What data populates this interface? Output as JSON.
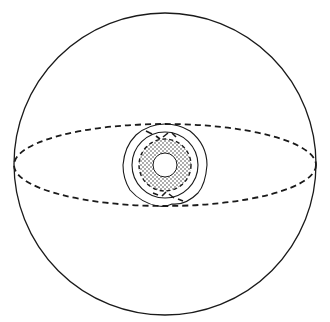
{
  "diagram": {
    "stroke_color": "#1a1a1a",
    "background": "#ffffff",
    "sphere": {
      "cx": 165,
      "cy": 164,
      "r": 151
    },
    "equator": {
      "cx": 165,
      "cy": 165,
      "rx": 151,
      "ry": 41,
      "style": "dashed"
    },
    "core": {
      "cx": 165,
      "cy": 165,
      "outer_ring_r": 41,
      "middle_ring_r": 33,
      "torus_outer_r": 26,
      "torus_inner_r": 12,
      "torus_fill": "dotted"
    }
  }
}
